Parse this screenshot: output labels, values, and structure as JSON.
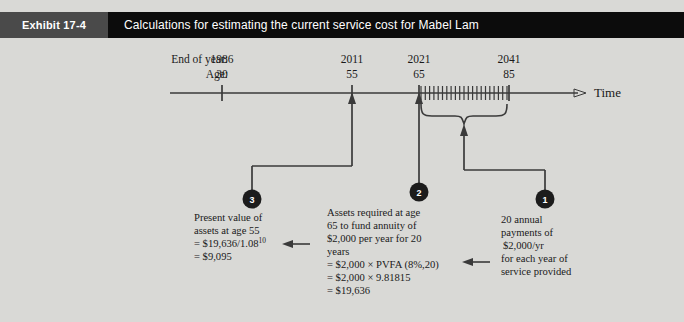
{
  "header": {
    "tag": "Exhibit 17-4",
    "title": "Calculations for estimating the current service cost for Mabel Lam"
  },
  "timeline": {
    "row_labels": {
      "year": "End of year:",
      "age": "Age:"
    },
    "axis_label": "Time",
    "points": [
      {
        "year": "1986",
        "age": "30"
      },
      {
        "year": "2011",
        "age": "55"
      },
      {
        "year": "2021",
        "age": "65"
      },
      {
        "year": "2041",
        "age": "85"
      }
    ],
    "tick_count": 20
  },
  "markers": [
    {
      "id": "1",
      "label": "1"
    },
    {
      "id": "2",
      "label": "2"
    },
    {
      "id": "3",
      "label": "3"
    }
  ],
  "notes": {
    "note3": {
      "marker": "3",
      "lines": [
        "Present value of",
        "assets at age 55",
        "= $19,636/1.08",
        "= $9,095"
      ],
      "exponent": "10"
    },
    "note2": {
      "marker": "2",
      "lines": [
        "Assets required at age",
        "65 to fund annuity of",
        "$2,000 per year for 20",
        "years",
        "= $2,000 × PVFA (8%,20)",
        "= $2,000 × 9.81815",
        "= $19,636"
      ]
    },
    "note1": {
      "marker": "1",
      "lines": [
        "20 annual",
        "payments of",
        "$2,000/yr",
        "for each year of",
        "service provided"
      ]
    }
  },
  "colors": {
    "background": "#d9d9d6",
    "header_tag": "#4a4a4a",
    "header_title": "#0c0c0c",
    "line": "#3a3a3a",
    "marker_fill": "#1c1c1c",
    "text": "#1a1a1a"
  }
}
